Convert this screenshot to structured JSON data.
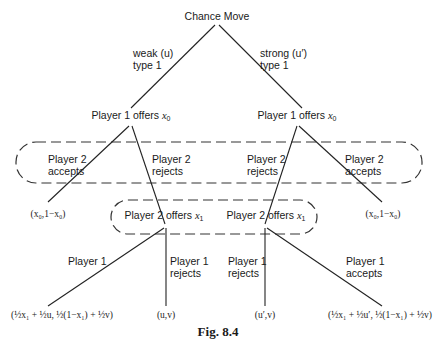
{
  "diagram": {
    "type": "game-tree",
    "root": {
      "label": "Chance Move"
    },
    "chance_branches": [
      {
        "label_line1": "weak (u)",
        "label_line2": "type 1"
      },
      {
        "label_line1": "strong (u′)",
        "label_line2": "type 1"
      }
    ],
    "player1_nodes": [
      {
        "label": "Player 1 offers ",
        "var": "x",
        "sub": "0"
      },
      {
        "label": "Player 1 offers ",
        "var": "x",
        "sub": "0"
      }
    ],
    "player2_responses": {
      "left_accept": {
        "line1": "Player 2",
        "line2": "accepts"
      },
      "left_reject": {
        "line1": "Player 2",
        "line2": "rejects"
      },
      "right_reject": {
        "line1": "Player 2",
        "line2": "rejects"
      },
      "right_accept": {
        "line1": "Player 2",
        "line2": "accepts"
      }
    },
    "payoff_accept_x0": "(x₀,1−x₀)",
    "player2_nodes": [
      {
        "label": "Player 2 offers ",
        "var": "x",
        "sub": "1"
      },
      {
        "label": "Player 2 offers ",
        "var": "x",
        "sub": "1"
      }
    ],
    "player1_responses": {
      "left_accept": {
        "line1": "Player 1",
        "line2": ""
      },
      "left_reject": {
        "line1": "Player 1",
        "line2": "rejects"
      },
      "right_reject": {
        "line1": "Player 1",
        "line2": "rejects"
      },
      "right_accept": {
        "line1": "Player 1",
        "line2": "accepts"
      }
    },
    "terminal_payoffs": {
      "left_accept": "(½x₁ + ½u, ½(1−x₁) + ½v)",
      "left_reject": "(u,v)",
      "right_reject": "(u′,v)",
      "right_accept": "(½x₁ + ½u′, ½(1−x₁) + ½v)"
    },
    "information_sets": [
      {
        "name": "player2-info-set",
        "style": "dashed"
      },
      {
        "name": "player1-info-set",
        "style": "dashed"
      }
    ],
    "caption": "Fig. 8.4"
  }
}
